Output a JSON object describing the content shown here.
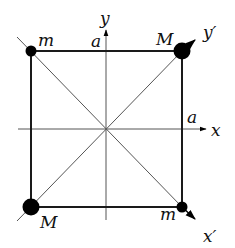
{
  "diagram": {
    "type": "square-lattice-with-axes",
    "colors": {
      "line": "#1a1a1a",
      "thin_line": "#555555",
      "dot": "#000000",
      "background": "#ffffff"
    },
    "corners": {
      "top_left": {
        "label": "m",
        "dot": "small"
      },
      "top_right": {
        "label": "M",
        "dot": "large"
      },
      "bottom_left": {
        "label": "M",
        "dot": "large"
      },
      "bottom_right": {
        "label": "m",
        "dot": "small"
      }
    },
    "axes": {
      "x": {
        "label": "x",
        "length_label": "a"
      },
      "y": {
        "label": "y",
        "length_label": "a"
      },
      "x_prime": {
        "label": "x′"
      },
      "y_prime": {
        "label": "y′"
      }
    }
  }
}
